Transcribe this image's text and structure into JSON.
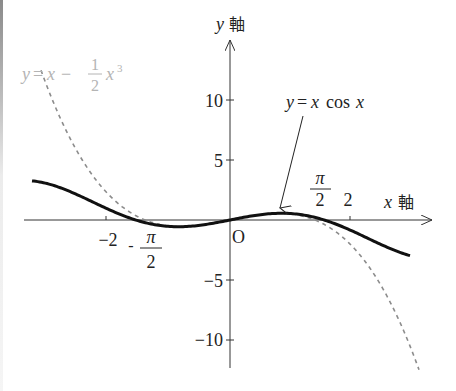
{
  "chart_data": {
    "type": "line",
    "title": "",
    "xlabel": "x 軸",
    "ylabel": "y 軸",
    "xlim": [
      -3.45,
      3.45
    ],
    "ylim": [
      -12.4,
      15
    ],
    "grid": false,
    "origin_label": "O",
    "x_ticks": [
      {
        "value": -2,
        "label": "−2"
      },
      {
        "value": -1.5708,
        "label": "−π/2",
        "frac_num": "π",
        "frac_den": "2",
        "sign": "-"
      },
      {
        "value": 1.5708,
        "label": "π/2",
        "frac_num": "π",
        "frac_den": "2"
      },
      {
        "value": 2,
        "label": "2"
      }
    ],
    "y_ticks": [
      {
        "value": 10,
        "label": "10"
      },
      {
        "value": 5,
        "label": "5"
      },
      {
        "value": -5,
        "label": "−5"
      },
      {
        "value": -10,
        "label": "−10"
      }
    ],
    "series": [
      {
        "name": "y=x cos x",
        "style": "solid",
        "color": "#111111",
        "expression": "x*cos(x)",
        "domain": [
          -3.3,
          3.0
        ],
        "x": [
          -3.3,
          -3.0,
          -2.5,
          -2.0,
          -1.5708,
          -1.0,
          -0.86,
          -0.5,
          0,
          0.5,
          0.86,
          1.0,
          1.5708,
          2.0,
          2.5,
          3.0
        ],
        "values": [
          3.26,
          2.97,
          2.0,
          0.83,
          0.0,
          -0.54,
          -0.56,
          -0.44,
          0,
          0.44,
          0.56,
          0.54,
          0.0,
          -0.83,
          -2.0,
          -2.97
        ]
      },
      {
        "name": "y=x−(1/2)x³",
        "style": "dashed",
        "color": "#8c8c8c",
        "expression": "x - 0.5*x^3",
        "domain": [
          -3.15,
          3.15
        ],
        "x": [
          -3.15,
          -3.0,
          -2.5,
          -2.0,
          -1.414,
          -1.0,
          0,
          1.0,
          1.414,
          2.0,
          2.5,
          3.0,
          3.15
        ],
        "values": [
          12.48,
          10.5,
          5.31,
          2.0,
          0.0,
          -0.5,
          0,
          0.5,
          0.0,
          -2.0,
          -5.31,
          -10.5,
          -12.48
        ]
      }
    ],
    "annotations": [
      {
        "text": "y=x cos x",
        "target": "solid curve near local max at x≈0.86",
        "arrow": true
      },
      {
        "text": "y=x−(1/2)x³",
        "color": "#b0b0b0",
        "position": "top-left"
      }
    ]
  },
  "labels": {
    "y_axis_var": "y",
    "y_axis_kanji": "軸",
    "x_axis_var": "x",
    "x_axis_kanji": "軸",
    "origin": "O",
    "tick_neg2": "−2",
    "tick_pos2": "2",
    "tick_y10": "10",
    "tick_y5": "5",
    "tick_yneg5": "−5",
    "tick_yneg10": "−10",
    "pi": "π",
    "two": "2",
    "neg_sign": "-",
    "solid_label_y": "y",
    "solid_label_eq": "=",
    "solid_label_x": "x",
    "solid_label_cos": "cos",
    "solid_label_x2": "x",
    "dashed_label_y": "y",
    "dashed_label_eq": "=",
    "dashed_label_x": "x",
    "dashed_label_minus": "−",
    "dashed_label_num": "1",
    "dashed_label_den": "2",
    "dashed_label_x3": "x",
    "dashed_label_exp": "3"
  },
  "colors": {
    "axis": "#333333",
    "solid_curve": "#111111",
    "dashed_curve": "#8c8c8c",
    "dashed_label": "#b4b4b4",
    "text": "#222222"
  }
}
